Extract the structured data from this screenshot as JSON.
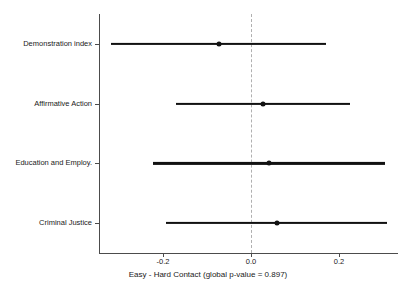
{
  "chart_data": {
    "type": "scatter",
    "subtype": "coefficient-forest-plot",
    "title": "",
    "xlabel": "Easy - Hard Contact (global p-value = 0.897)",
    "ylabel": "",
    "global_p_value": 0.897,
    "grid": false,
    "legend": null,
    "zero_reference_line": 0.0,
    "xlim": [
      -0.345,
      0.34
    ],
    "xticks": [
      -0.2,
      0.0,
      0.2
    ],
    "xticklabels": [
      "-0.2",
      "0.0",
      "0.2"
    ],
    "categories": [
      "Demonstration index",
      "Affirmative Action",
      "Education and Employ.",
      "Criminal Justice"
    ],
    "estimates": [
      -0.072,
      0.027,
      0.04,
      0.06
    ],
    "ci_low": [
      -0.318,
      -0.17,
      -0.223,
      -0.193
    ],
    "ci_high": [
      0.17,
      0.225,
      0.305,
      0.308
    ],
    "points": [
      {
        "label": "Demonstration index",
        "estimate": -0.072,
        "ci_low": -0.318,
        "ci_high": 0.17
      },
      {
        "label": "Affirmative Action",
        "estimate": 0.027,
        "ci_low": -0.17,
        "ci_high": 0.225
      },
      {
        "label": "Education and Employ.",
        "estimate": 0.04,
        "ci_low": -0.223,
        "ci_high": 0.305
      },
      {
        "label": "Criminal Justice",
        "estimate": 0.06,
        "ci_low": -0.193,
        "ci_high": 0.308
      }
    ],
    "colors": {
      "point": "#111111",
      "interval": "#111111",
      "zero_line": "#b0b0b0",
      "axis": "#4c4c4c",
      "background": "#ffffff"
    }
  }
}
